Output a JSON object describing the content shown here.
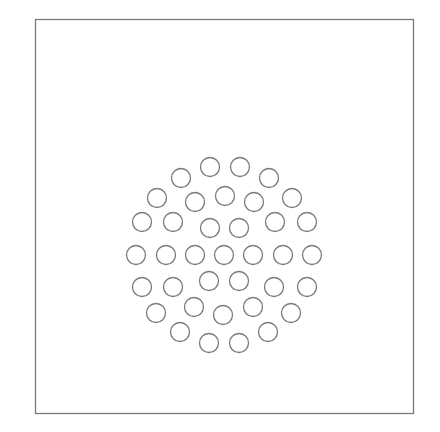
{
  "diagram": {
    "frame": {
      "x": 35,
      "y": 19,
      "width": 378,
      "height": 394,
      "stroke": "#7a7a7a"
    },
    "circle_style": {
      "radius": 9.5,
      "stroke": "#7a7a7a",
      "fill": "none",
      "stroke_width": 1.3
    },
    "circles": [
      {
        "cx": 210,
        "cy": 167
      },
      {
        "cx": 240,
        "cy": 167
      },
      {
        "cx": 181,
        "cy": 178
      },
      {
        "cx": 269,
        "cy": 178
      },
      {
        "cx": 157,
        "cy": 198
      },
      {
        "cx": 195,
        "cy": 202
      },
      {
        "cx": 225,
        "cy": 196
      },
      {
        "cx": 254,
        "cy": 202
      },
      {
        "cx": 292,
        "cy": 198
      },
      {
        "cx": 142,
        "cy": 222
      },
      {
        "cx": 173,
        "cy": 222
      },
      {
        "cx": 210,
        "cy": 228
      },
      {
        "cx": 239,
        "cy": 228
      },
      {
        "cx": 275,
        "cy": 222
      },
      {
        "cx": 307,
        "cy": 222
      },
      {
        "cx": 136,
        "cy": 255
      },
      {
        "cx": 166,
        "cy": 255
      },
      {
        "cx": 195,
        "cy": 255
      },
      {
        "cx": 224,
        "cy": 255
      },
      {
        "cx": 253,
        "cy": 255
      },
      {
        "cx": 283,
        "cy": 255
      },
      {
        "cx": 312,
        "cy": 255
      },
      {
        "cx": 142,
        "cy": 287
      },
      {
        "cx": 173,
        "cy": 287
      },
      {
        "cx": 209,
        "cy": 281
      },
      {
        "cx": 239,
        "cy": 281
      },
      {
        "cx": 274,
        "cy": 287
      },
      {
        "cx": 307,
        "cy": 287
      },
      {
        "cx": 156,
        "cy": 313
      },
      {
        "cx": 194,
        "cy": 307
      },
      {
        "cx": 223,
        "cy": 315
      },
      {
        "cx": 253,
        "cy": 307
      },
      {
        "cx": 291,
        "cy": 313
      },
      {
        "cx": 180,
        "cy": 332
      },
      {
        "cx": 209,
        "cy": 343
      },
      {
        "cx": 239,
        "cy": 343
      },
      {
        "cx": 268,
        "cy": 332
      }
    ]
  }
}
